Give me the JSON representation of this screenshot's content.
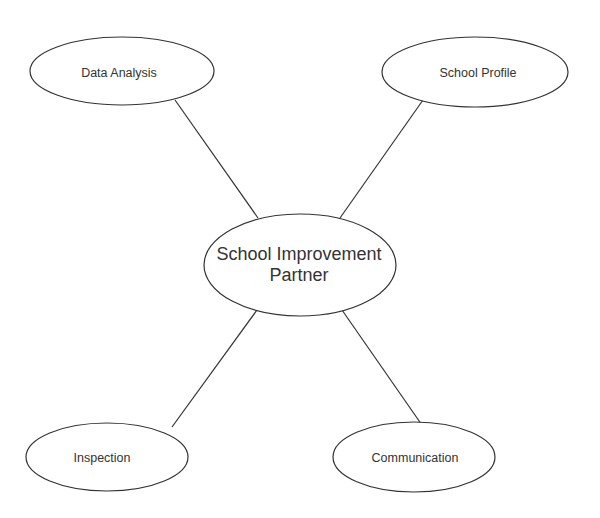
{
  "diagram": {
    "type": "mind-map",
    "stroke_color": "#333333",
    "background": "#ffffff",
    "center": {
      "label_line1": "School Improvement",
      "label_line2": "Partner"
    },
    "nodes": [
      {
        "id": "data-analysis",
        "label": "Data Analysis"
      },
      {
        "id": "school-profile",
        "label": "School Profile"
      },
      {
        "id": "inspection",
        "label": "Inspection"
      },
      {
        "id": "communication",
        "label": "Communication"
      }
    ],
    "edges": [
      {
        "from": "center",
        "to": "data-analysis"
      },
      {
        "from": "center",
        "to": "school-profile"
      },
      {
        "from": "center",
        "to": "inspection"
      },
      {
        "from": "center",
        "to": "communication"
      }
    ]
  }
}
